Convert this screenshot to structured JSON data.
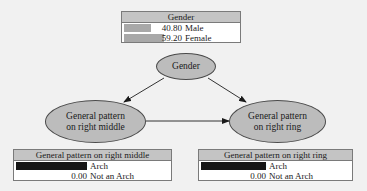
{
  "diagram": {
    "type": "bayesian-network",
    "nodes": [
      {
        "id": "gender",
        "label_line1": "Gender",
        "label_line2": ""
      },
      {
        "id": "middle",
        "label_line1": "General pattern",
        "label_line2": "on right middle"
      },
      {
        "id": "ring",
        "label_line1": "General pattern",
        "label_line2": "on right ring"
      }
    ],
    "edges": [
      {
        "from": "gender",
        "to": "middle"
      },
      {
        "from": "gender",
        "to": "ring"
      },
      {
        "from": "middle",
        "to": "ring"
      }
    ]
  },
  "tables": {
    "gender": {
      "title": "Gender",
      "bar_color": "#a8a8a8",
      "rows": [
        {
          "value": "40.80",
          "label": "Male",
          "pct": 40.8
        },
        {
          "value": "59.20",
          "label": "Female",
          "pct": 59.2
        }
      ]
    },
    "middle": {
      "title": "General pattern on right middle",
      "bar_color": "#151515",
      "rows": [
        {
          "value": "100.00",
          "label": "Arch",
          "pct": 100
        },
        {
          "value": "0.00",
          "label": "Not an Arch",
          "pct": 0
        }
      ]
    },
    "ring": {
      "title": "General pattern on right ring",
      "bar_color": "#151515",
      "rows": [
        {
          "value": "100.00",
          "label": "Arch",
          "pct": 100
        },
        {
          "value": "0.00",
          "label": "Not an Arch",
          "pct": 0
        }
      ]
    }
  },
  "colors": {
    "background": "#f1f1f1",
    "node_fill": "#bcbcbc",
    "header_fill": "#c4c4c4",
    "edge": "#333333"
  }
}
